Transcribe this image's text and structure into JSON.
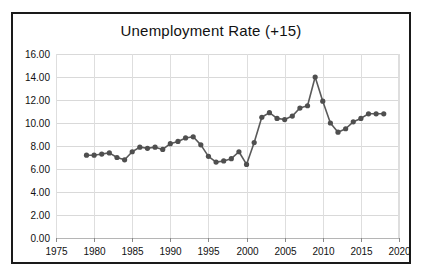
{
  "chart_data": {
    "type": "line",
    "title": "Unemployment Rate (+15)",
    "xlabel": "",
    "ylabel": "",
    "xlim": [
      1975,
      2020
    ],
    "ylim": [
      0,
      16
    ],
    "grid": true,
    "legend": null,
    "marker": "circle",
    "line_color": "#5a5a5a",
    "marker_color": "#4f4f4f",
    "xticks": [
      1975,
      1980,
      1985,
      1990,
      1995,
      2000,
      2005,
      2010,
      2015,
      2020
    ],
    "xtick_labels": [
      "1975",
      "1980",
      "1985",
      "1990",
      "1995",
      "2000",
      "2005",
      "2010",
      "2015",
      "2020"
    ],
    "yticks": [
      0,
      2,
      4,
      6,
      8,
      10,
      12,
      14,
      16
    ],
    "ytick_labels": [
      "0.00",
      "2.00",
      "4.00",
      "6.00",
      "8.00",
      "10.00",
      "12.00",
      "14.00",
      "16.00"
    ],
    "x": [
      1979,
      1980,
      1981,
      1982,
      1983,
      1984,
      1985,
      1986,
      1987,
      1988,
      1989,
      1990,
      1991,
      1992,
      1993,
      1994,
      1995,
      1996,
      1997,
      1998,
      1999,
      2000,
      2001,
      2002,
      2003,
      2004,
      2005,
      2006,
      2007,
      2008,
      2009,
      2010,
      2011,
      2012,
      2013,
      2014,
      2015,
      2016,
      2017,
      2018
    ],
    "values": [
      7.2,
      7.2,
      7.3,
      7.4,
      7.0,
      6.8,
      7.5,
      7.9,
      7.8,
      7.9,
      7.7,
      8.2,
      8.4,
      8.7,
      8.8,
      8.1,
      7.1,
      6.6,
      6.7,
      6.9,
      7.5,
      6.4,
      8.3,
      10.5,
      10.9,
      10.4,
      10.3,
      10.6,
      11.3,
      11.5,
      14.0,
      11.9,
      10.0,
      9.2,
      9.5,
      10.1,
      10.4,
      10.8,
      10.8,
      10.8
    ],
    "series_name": "Unemployment Rate (+15)"
  }
}
